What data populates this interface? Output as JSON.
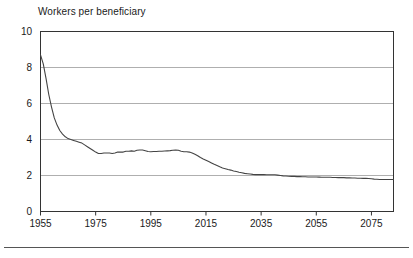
{
  "chart_data": {
    "type": "line",
    "title": "Workers per beneficiary",
    "xlabel": "",
    "ylabel": "Workers per beneficiary",
    "xlim": [
      1955,
      2083
    ],
    "ylim": [
      0,
      10
    ],
    "yticks": [
      0,
      2,
      4,
      6,
      8,
      10
    ],
    "ytick_labels": [
      "0",
      "2",
      "4",
      "6",
      "8",
      "10"
    ],
    "xticks": [
      1955,
      1975,
      1995,
      2015,
      2035,
      2055,
      2075
    ],
    "xtick_labels": [
      "1955",
      "1975",
      "1995",
      "2015",
      "2035",
      "2055",
      "2075"
    ],
    "grid": "horizontal",
    "legend": "none",
    "line_color": "#444444",
    "series": [
      {
        "name": "Workers per beneficiary",
        "x": [
          1955,
          1956,
          1957,
          1958,
          1959,
          1960,
          1961,
          1962,
          1963,
          1964,
          1965,
          1966,
          1967,
          1968,
          1969,
          1970,
          1971,
          1972,
          1973,
          1974,
          1975,
          1976,
          1977,
          1978,
          1979,
          1980,
          1981,
          1982,
          1983,
          1984,
          1985,
          1986,
          1987,
          1988,
          1989,
          1990,
          1991,
          1992,
          1993,
          1994,
          1995,
          1996,
          1997,
          1998,
          1999,
          2000,
          2001,
          2002,
          2003,
          2004,
          2005,
          2006,
          2007,
          2008,
          2009,
          2010,
          2011,
          2012,
          2013,
          2014,
          2015,
          2016,
          2017,
          2018,
          2019,
          2020,
          2021,
          2022,
          2023,
          2024,
          2025,
          2026,
          2027,
          2028,
          2029,
          2030,
          2031,
          2032,
          2033,
          2034,
          2035,
          2036,
          2037,
          2038,
          2039,
          2040,
          2041,
          2042,
          2043,
          2044,
          2045,
          2046,
          2047,
          2048,
          2049,
          2050,
          2051,
          2052,
          2053,
          2054,
          2055,
          2056,
          2057,
          2058,
          2059,
          2060,
          2061,
          2062,
          2063,
          2064,
          2065,
          2066,
          2067,
          2068,
          2069,
          2070,
          2071,
          2072,
          2073,
          2074,
          2075,
          2076,
          2077,
          2078,
          2079,
          2080,
          2081,
          2082,
          2083
        ],
        "y": [
          8.7,
          8.2,
          7.4,
          6.5,
          5.8,
          5.2,
          4.8,
          4.5,
          4.3,
          4.15,
          4.05,
          4.0,
          3.95,
          3.9,
          3.85,
          3.8,
          3.7,
          3.6,
          3.5,
          3.4,
          3.3,
          3.22,
          3.22,
          3.25,
          3.25,
          3.25,
          3.22,
          3.25,
          3.3,
          3.3,
          3.3,
          3.35,
          3.35,
          3.37,
          3.35,
          3.4,
          3.42,
          3.42,
          3.38,
          3.33,
          3.32,
          3.33,
          3.33,
          3.35,
          3.35,
          3.36,
          3.37,
          3.38,
          3.4,
          3.42,
          3.4,
          3.35,
          3.32,
          3.32,
          3.3,
          3.25,
          3.18,
          3.1,
          3.0,
          2.92,
          2.85,
          2.78,
          2.7,
          2.62,
          2.55,
          2.48,
          2.42,
          2.38,
          2.33,
          2.3,
          2.25,
          2.22,
          2.18,
          2.15,
          2.12,
          2.1,
          2.08,
          2.06,
          2.05,
          2.05,
          2.05,
          2.05,
          2.04,
          2.04,
          2.04,
          2.04,
          2.02,
          2.0,
          1.98,
          1.97,
          1.96,
          1.95,
          1.95,
          1.94,
          1.94,
          1.93,
          1.93,
          1.92,
          1.92,
          1.92,
          1.92,
          1.91,
          1.9,
          1.9,
          1.9,
          1.9,
          1.89,
          1.89,
          1.88,
          1.88,
          1.88,
          1.87,
          1.87,
          1.86,
          1.86,
          1.85,
          1.85,
          1.84,
          1.84,
          1.83,
          1.82,
          1.8,
          1.79,
          1.78,
          1.78,
          1.78,
          1.78,
          1.78,
          1.78
        ]
      }
    ]
  }
}
